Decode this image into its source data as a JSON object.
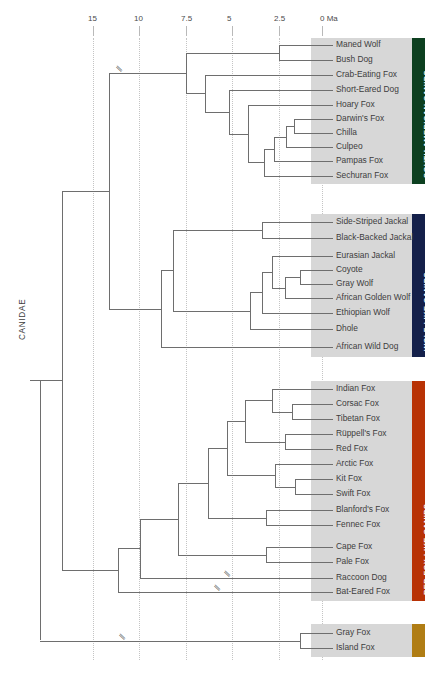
{
  "figure": {
    "type": "phylogenetic-tree",
    "root_label": "CANIDAE",
    "axis": {
      "unit_label": "0 Ma",
      "ticks": [
        {
          "label": "15",
          "value": 15,
          "x": 93
        },
        {
          "label": "10",
          "value": 10,
          "x": 139
        },
        {
          "label": "7.5",
          "value": 7.5,
          "x": 186
        },
        {
          "label": "5",
          "value": 5,
          "x": 232
        },
        {
          "label": "2.5",
          "value": 2.5,
          "x": 279
        },
        {
          "label": "0 Ma",
          "value": 0,
          "x": 322
        }
      ]
    },
    "groups": [
      {
        "name": "SOUTH AMERICAN CANIDS",
        "color": "#0d4020",
        "taxa": [
          "Maned Wolf",
          "Bush Dog",
          "Crab-Eating Fox",
          "Short-Eared Dog",
          "Hoary Fox",
          "Darwin's Fox",
          "Chilla",
          "Culpeo",
          "Pampas Fox",
          "Sechuran Fox"
        ]
      },
      {
        "name": "WOLF-LIKE CANIDS",
        "color": "#14204a",
        "taxa": [
          "Side-Striped Jackal",
          "Black-Backed Jackal",
          "Eurasian Jackal",
          "Coyote",
          "Gray Wolf",
          "African Golden Wolf",
          "Ethiopian Wolf",
          "Dhole",
          "African Wild Dog"
        ]
      },
      {
        "name": "RED FOX-LIKE CANIDS",
        "color": "#b83205",
        "taxa": [
          "Indian Fox",
          "Corsac Fox",
          "Tibetan Fox",
          "Rüppell's Fox",
          "Red Fox",
          "Arctic Fox",
          "Kit Fox",
          "Swift Fox",
          "Blanford's Fox",
          "Fennec Fox",
          "Cape Fox",
          "Pale Fox",
          "Raccoon Dog",
          "Bat-Eared Fox"
        ]
      },
      {
        "name": "",
        "color": "#b07d14",
        "taxa": [
          "Gray Fox",
          "Island Fox"
        ]
      }
    ]
  },
  "chart_data": {
    "type": "tree",
    "title": "",
    "xlabel": "0 Ma",
    "xlim": [
      15,
      0
    ],
    "grid": true,
    "tick_labels": [
      "15",
      "10",
      "7.5",
      "5",
      "2.5",
      "0 Ma"
    ],
    "tick_values": [
      15,
      10,
      7.5,
      5,
      2.5,
      0
    ],
    "legend": [
      "SOUTH AMERICAN CANIDS",
      "WOLF-LIKE CANIDS",
      "RED FOX-LIKE CANIDS"
    ],
    "tips": [
      {
        "name": "Maned Wolf",
        "y": 45,
        "branch_start": 2.2
      },
      {
        "name": "Bush Dog",
        "y": 60,
        "branch_start": 2.2
      },
      {
        "name": "Crab-Eating Fox",
        "y": 75,
        "branch_start": 5.2
      },
      {
        "name": "Short-Eared Dog",
        "y": 90,
        "branch_start": 4.6
      },
      {
        "name": "Hoary Fox",
        "y": 105,
        "branch_start": 2.8
      },
      {
        "name": "Darwin's Fox",
        "y": 119,
        "branch_start": 1.4
      },
      {
        "name": "Chilla",
        "y": 133,
        "branch_start": 1.0
      },
      {
        "name": "Culpeo",
        "y": 147,
        "branch_start": 1.4
      },
      {
        "name": "Pampas Fox",
        "y": 161,
        "branch_start": 2.0
      },
      {
        "name": "Sechuran Fox",
        "y": 176,
        "branch_start": 2.5
      },
      {
        "name": "Side-Striped Jackal",
        "y": 222,
        "branch_start": 2.7
      },
      {
        "name": "Black-Backed Jackal",
        "y": 238,
        "branch_start": 2.7
      },
      {
        "name": "Eurasian Jackal",
        "y": 256,
        "branch_start": 2.0
      },
      {
        "name": "Coyote",
        "y": 270,
        "branch_start": 1.0
      },
      {
        "name": "Gray Wolf",
        "y": 284,
        "branch_start": 1.0
      },
      {
        "name": "African Golden Wolf",
        "y": 298,
        "branch_start": 1.6
      },
      {
        "name": "Ethiopian Wolf",
        "y": 313,
        "branch_start": 2.4
      },
      {
        "name": "Dhole",
        "y": 329,
        "branch_start": 2.8
      },
      {
        "name": "African Wild Dog",
        "y": 347,
        "branch_start": 5.4
      },
      {
        "name": "Indian Fox",
        "y": 389,
        "branch_start": 2.6
      },
      {
        "name": "Corsac Fox",
        "y": 404,
        "branch_start": 1.7
      },
      {
        "name": "Tibetan Fox",
        "y": 419,
        "branch_start": 1.7
      },
      {
        "name": "Rüppell's Fox",
        "y": 434,
        "branch_start": 2.0
      },
      {
        "name": "Red Fox",
        "y": 449,
        "branch_start": 2.0
      },
      {
        "name": "Arctic Fox",
        "y": 464,
        "branch_start": 2.1
      },
      {
        "name": "Kit Fox",
        "y": 479,
        "branch_start": 1.5
      },
      {
        "name": "Swift Fox",
        "y": 494,
        "branch_start": 1.5
      },
      {
        "name": "Blanford's Fox",
        "y": 510,
        "branch_start": 3.0
      },
      {
        "name": "Fennec Fox",
        "y": 525,
        "branch_start": 3.0
      },
      {
        "name": "Cape Fox",
        "y": 547,
        "branch_start": 3.0
      },
      {
        "name": "Pale Fox",
        "y": 562,
        "branch_start": 3.0
      },
      {
        "name": "Raccoon Dog",
        "y": 578,
        "branch_start": 7.4
      },
      {
        "name": "Bat-Eared Fox",
        "y": 592,
        "branch_start": 9.5
      },
      {
        "name": "Gray Fox",
        "y": 633,
        "branch_start": 2.4
      },
      {
        "name": "Island Fox",
        "y": 648,
        "branch_start": 2.4
      }
    ]
  }
}
